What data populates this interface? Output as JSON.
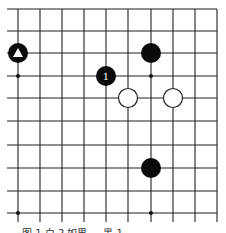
{
  "board": {
    "cols_x": [
      18,
      40,
      62,
      84,
      106,
      128,
      151,
      173,
      195,
      217
    ],
    "rows_y": [
      9,
      31,
      53,
      76,
      98,
      121,
      145,
      168,
      191,
      213
    ],
    "line_color": "#222222",
    "star_points": [
      [
        0,
        3
      ],
      [
        6,
        3
      ],
      [
        0,
        9
      ],
      [
        6,
        9
      ]
    ],
    "stones": [
      {
        "color": "black",
        "col": 0,
        "row": 2,
        "mark": "triangle"
      },
      {
        "color": "black",
        "col": 6,
        "row": 2,
        "mark": ""
      },
      {
        "color": "black",
        "col": 4,
        "row": 3,
        "mark": "1"
      },
      {
        "color": "white",
        "col": 5,
        "row": 4,
        "mark": ""
      },
      {
        "color": "white",
        "col": 7,
        "row": 4,
        "mark": ""
      },
      {
        "color": "black",
        "col": 6,
        "row": 7,
        "mark": ""
      }
    ]
  },
  "caption": "图 1 白 2 如果 ... 黑 1 ..."
}
